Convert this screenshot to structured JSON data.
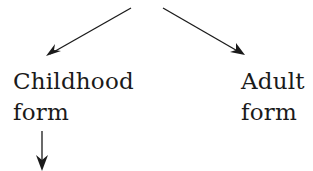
{
  "diagram": {
    "type": "tree",
    "nodes": [
      {
        "id": "childhood",
        "lines": [
          "Childhood",
          "form"
        ]
      },
      {
        "id": "adult",
        "lines": [
          "Adult",
          "form"
        ]
      }
    ],
    "edges": [
      {
        "from": "parent (off-screen, top)",
        "to": "childhood",
        "direction": "down-left"
      },
      {
        "from": "parent (off-screen, top)",
        "to": "adult",
        "direction": "down-right"
      },
      {
        "from": "childhood",
        "to": "child (off-screen, bottom)",
        "direction": "down"
      }
    ],
    "colors": {
      "background": "#ffffff",
      "stroke": "#1a1a1a",
      "text": "#1a1a1a"
    }
  }
}
